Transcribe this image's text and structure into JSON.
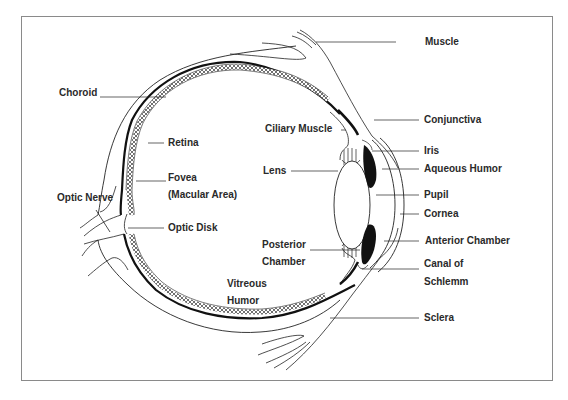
{
  "diagram": {
    "colors": {
      "line": "#222222",
      "frame": "#8a8a8a",
      "background": "#ffffff",
      "label": "#2a2a2a"
    },
    "labels": {
      "muscle": "Muscle",
      "choroid": "Choroid",
      "conjunctiva": "Conjunctiva",
      "ciliary_muscle": "Ciliary Muscle",
      "iris": "Iris",
      "retina": "Retina",
      "lens": "Lens",
      "aqueous_humor": "Aqueous Humor",
      "fovea": "Fovea",
      "macular_area": "(Macular Area)",
      "optic_nerve": "Optic Nerve",
      "pupil": "Pupil",
      "cornea": "Cornea",
      "optic_disk": "Optic Disk",
      "anterior_chamber": "Anterior Chamber",
      "posterior": "Posterior",
      "chamber": "Chamber",
      "canal_of": "Canal of",
      "schlemm": "Schlemm",
      "vitreous": "Vitreous",
      "humor": "Humor",
      "sclera": "Sclera"
    }
  }
}
